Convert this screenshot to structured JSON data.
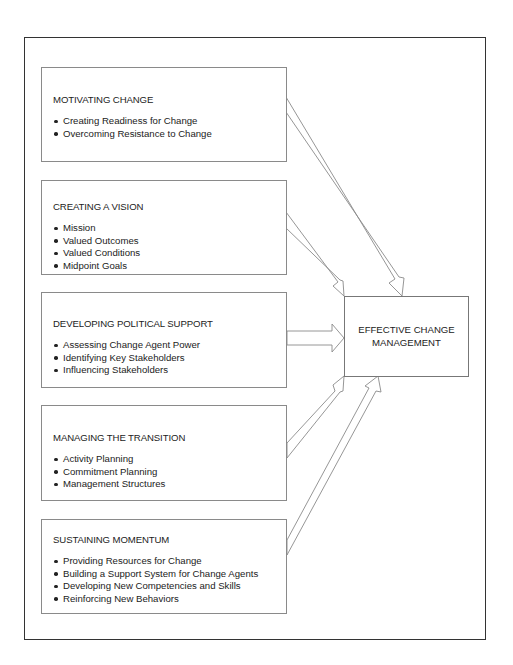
{
  "diagram": {
    "target": {
      "line1": "EFFECTIVE CHANGE",
      "line2": "MANAGEMENT"
    },
    "boxes": [
      {
        "title": "MOTIVATING CHANGE",
        "items": [
          "Creating Readiness for Change",
          "Overcoming Resistance to Change"
        ]
      },
      {
        "title": "CREATING A VISION",
        "items": [
          "Mission",
          "Valued Outcomes",
          "Valued Conditions",
          "Midpoint Goals"
        ]
      },
      {
        "title": "DEVELOPING POLITICAL SUPPORT",
        "items": [
          "Assessing Change Agent Power",
          "Identifying Key Stakeholders",
          "Influencing Stakeholders"
        ]
      },
      {
        "title": "MANAGING THE TRANSITION",
        "items": [
          "Activity Planning",
          "Commitment Planning",
          "Management Structures"
        ]
      },
      {
        "title": "SUSTAINING MOMENTUM",
        "items": [
          "Providing Resources for Change",
          "Building a Support System for Change Agents",
          "Developing New Competencies and Skills",
          "Reinforcing New Behaviors"
        ]
      }
    ],
    "connections": [
      {
        "from": "MOTIVATING CHANGE",
        "to": "EFFECTIVE CHANGE MANAGEMENT"
      },
      {
        "from": "CREATING A VISION",
        "to": "EFFECTIVE CHANGE MANAGEMENT"
      },
      {
        "from": "DEVELOPING POLITICAL SUPPORT",
        "to": "EFFECTIVE CHANGE MANAGEMENT"
      },
      {
        "from": "MANAGING THE TRANSITION",
        "to": "EFFECTIVE CHANGE MANAGEMENT"
      },
      {
        "from": "SUSTAINING MOMENTUM",
        "to": "EFFECTIVE CHANGE MANAGEMENT"
      }
    ]
  }
}
